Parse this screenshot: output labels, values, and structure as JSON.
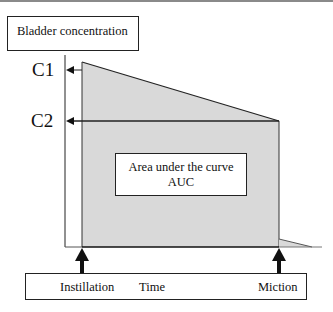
{
  "diagram": {
    "y_axis_label": "Bladder concentration",
    "x_axis_label": "Time",
    "levels": [
      {
        "id": "C1",
        "label": "C1"
      },
      {
        "id": "C2",
        "label": "C2"
      }
    ],
    "events": [
      {
        "id": "instillation",
        "label": "Instillation"
      },
      {
        "id": "miction",
        "label": "Miction"
      }
    ],
    "area_label": {
      "line1": "Area under the curve",
      "line2": "AUC"
    },
    "colors": {
      "area_fill": "#d9d9d9",
      "lines": "#222222"
    }
  }
}
